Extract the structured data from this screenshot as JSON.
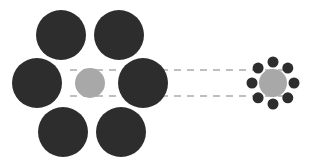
{
  "figure": {
    "name": "ebbinghaus-illusion",
    "canvas": {
      "width": 311,
      "height": 165
    },
    "background_color": "#FFFFFF"
  },
  "colors": {
    "inducer_dark": "#2D2D2D",
    "target_gray": "#A8A8A8",
    "guide_line": "#BFBFBF",
    "background": "#FFFFFF"
  },
  "left_cluster": {
    "name": "large-inducers-cluster",
    "target": {
      "label": "target-circle-left",
      "cx": 90,
      "cy": 83,
      "r": 15,
      "color": "#A8A8A8"
    },
    "inducer_radius": 25,
    "inducer_color": "#2D2D2D",
    "inducer_count": 6,
    "inducers": [
      {
        "label": "inducer-top-left",
        "cx": 61,
        "cy": 35,
        "r": 25
      },
      {
        "label": "inducer-top-right",
        "cx": 119,
        "cy": 35,
        "r": 25
      },
      {
        "label": "inducer-middle-left",
        "cx": 37,
        "cy": 83,
        "r": 25
      },
      {
        "label": "inducer-middle-right",
        "cx": 143,
        "cy": 83,
        "r": 25
      },
      {
        "label": "inducer-bottom-left",
        "cx": 63,
        "cy": 132,
        "r": 25
      },
      {
        "label": "inducer-bottom-right",
        "cx": 121,
        "cy": 132,
        "r": 25
      }
    ]
  },
  "right_cluster": {
    "name": "small-inducers-cluster",
    "target": {
      "label": "target-circle-right",
      "cx": 273,
      "cy": 83,
      "r": 14,
      "color": "#A8A8A8"
    },
    "inducer_radius": 5.5,
    "inducer_color": "#2D2D2D",
    "inducer_count": 8,
    "inducer_ring_radius": 21,
    "inducers": [
      {
        "label": "inducer-n",
        "cx": 273,
        "cy": 62,
        "r": 5.5
      },
      {
        "label": "inducer-ne",
        "cx": 287.8,
        "cy": 68.1,
        "r": 5.5
      },
      {
        "label": "inducer-e",
        "cx": 294,
        "cy": 83,
        "r": 5.5
      },
      {
        "label": "inducer-se",
        "cx": 287.8,
        "cy": 97.8,
        "r": 5.5
      },
      {
        "label": "inducer-s",
        "cx": 273,
        "cy": 104,
        "r": 5.5
      },
      {
        "label": "inducer-sw",
        "cx": 258.1,
        "cy": 97.8,
        "r": 5.5
      },
      {
        "label": "inducer-w",
        "cx": 252,
        "cy": 83,
        "r": 5.5
      },
      {
        "label": "inducer-nw",
        "cx": 258.1,
        "cy": 68.1,
        "r": 5.5
      }
    ]
  },
  "guide_lines": {
    "name": "size-comparison-guides",
    "color": "#BFBFBF",
    "stroke_width": 2,
    "dash_pattern": "7 6",
    "lines": [
      {
        "label": "guide-line-top",
        "x1": 70,
        "y1": 70,
        "x2": 292,
        "y2": 70
      },
      {
        "label": "guide-line-bottom",
        "x1": 70,
        "y1": 96,
        "x2": 292,
        "y2": 96
      }
    ]
  }
}
